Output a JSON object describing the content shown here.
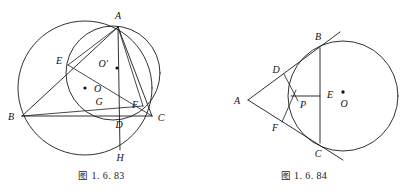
{
  "page": {
    "background": "#ffffff",
    "ink": "#1a1a1a",
    "width": 405,
    "height": 191
  },
  "figures": [
    {
      "id": "figure-left",
      "caption_cjk": "图",
      "caption_number": "1. 6. 83",
      "caption": "图 1. 6. 83",
      "description": "Triangle ABC inscribed in a large circle, with a second circle through A, E, D, F; altitude AH meets BC at D and the circumcircle at H; O is the incenter-like marked point, O' the center of the second circle, G a marked point.",
      "shapes": [
        {
          "name": "circumcircle",
          "type": "circle",
          "cx": 85,
          "cy": 88,
          "r": 67
        },
        {
          "name": "nine-point-circle",
          "type": "circle",
          "cx": 113,
          "cy": 73,
          "r": 47
        }
      ],
      "points": [
        {
          "label": "A",
          "x": 118,
          "y": 27,
          "lx": 118,
          "ly": 19,
          "dot": false
        },
        {
          "label": "B",
          "x": 22,
          "y": 116,
          "lx": 13,
          "ly": 119,
          "dot": false
        },
        {
          "label": "C",
          "x": 152,
          "y": 116,
          "lx": 160,
          "ly": 119,
          "dot": false
        },
        {
          "label": "D",
          "x": 120,
          "y": 116,
          "lx": 119,
          "ly": 127,
          "dot": false
        },
        {
          "label": "E",
          "x": 68,
          "y": 65,
          "lx": 59,
          "ly": 63,
          "dot": false
        },
        {
          "label": "F",
          "x": 143,
          "y": 106,
          "lx": 136,
          "ly": 107,
          "dot": false
        },
        {
          "label": "G",
          "x": 99,
          "y": 101,
          "lx": 99,
          "ly": 104,
          "dot": false
        },
        {
          "label": "H",
          "x": 120,
          "y": 150,
          "lx": 120,
          "ly": 160,
          "dot": false
        },
        {
          "label": "O",
          "x": 85,
          "y": 88,
          "lx": 93,
          "ly": 91,
          "dot": true
        },
        {
          "label": "O′",
          "x": 117,
          "y": 68,
          "lx": 109,
          "ly": 66,
          "dot": true
        }
      ],
      "segments": [
        {
          "name": "side-AB",
          "from": "A",
          "to": "B"
        },
        {
          "name": "side-BC",
          "from": "B",
          "to": "C"
        },
        {
          "name": "side-CA",
          "from": "C",
          "to": "A"
        },
        {
          "name": "altitude-AH",
          "from": "A",
          "to": "H"
        },
        {
          "name": "cevian-BF",
          "from": "B",
          "to": "F"
        },
        {
          "name": "cevian-CE",
          "from": "C",
          "to": "E"
        },
        {
          "name": "chord-AE",
          "from": "A",
          "to": "E"
        },
        {
          "name": "chord-AF",
          "from": "A",
          "to": "F"
        },
        {
          "name": "chord-EF",
          "from": "E",
          "to": "F"
        }
      ]
    },
    {
      "id": "figure-right",
      "caption_cjk": "图",
      "caption_number": "1. 6. 84",
      "caption": "图 1. 6. 84",
      "description": "Circle with center O; two tangents from external point A touch the circle at B and C; chord BC meets AO at E; D and F are tangency-side points; P is the intersection point inside.",
      "shapes": [
        {
          "name": "main-circle",
          "type": "circle",
          "cx": 140,
          "cy": 96,
          "r": 55
        }
      ],
      "points": [
        {
          "label": "A",
          "x": 45,
          "y": 100,
          "lx": 36,
          "ly": 102,
          "dot": false
        },
        {
          "label": "B",
          "x": 117,
          "y": 48,
          "lx": 115,
          "ly": 40,
          "dot": false
        },
        {
          "label": "C",
          "x": 117,
          "y": 143,
          "lx": 115,
          "ly": 155,
          "dot": false
        },
        {
          "label": "D",
          "x": 81,
          "y": 74,
          "lx": 73,
          "ly": 71,
          "dot": false
        },
        {
          "label": "E",
          "x": 117,
          "y": 96,
          "lx": 123,
          "ly": 94,
          "dot": false
        },
        {
          "label": "F",
          "x": 79,
          "y": 122,
          "lx": 72,
          "ly": 129,
          "dot": false
        },
        {
          "label": "P",
          "x": 97,
          "y": 96,
          "lx": 100,
          "ly": 105,
          "dot": false
        },
        {
          "label": "O",
          "x": 140,
          "y": 96,
          "lx": 143,
          "ly": 104,
          "dot": true
        }
      ],
      "segments": [
        {
          "name": "tangent-AB",
          "from": "A",
          "to": "B"
        },
        {
          "name": "tangent-AC",
          "from": "A",
          "to": "C"
        },
        {
          "name": "chord-BC",
          "from": "B",
          "to": "C"
        },
        {
          "name": "segment-PE",
          "from": "P",
          "to": "E"
        },
        {
          "name": "segment-DP",
          "from": "D",
          "to": "P"
        },
        {
          "name": "segment-PF",
          "from": "P",
          "to": "F"
        }
      ]
    }
  ]
}
